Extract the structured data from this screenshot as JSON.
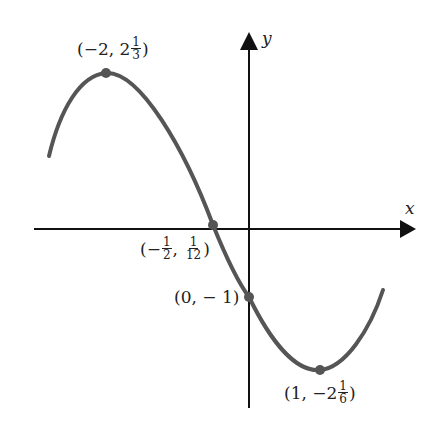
{
  "figure": {
    "type": "function-graph"
  },
  "axes": {
    "x_label": "x",
    "y_label": "y"
  },
  "points": [
    {
      "name": "local-maximum",
      "x": -2,
      "y": "2 1/3",
      "label": {
        "open": "(−2, 2",
        "num": "1",
        "den": "3",
        "close": ")"
      }
    },
    {
      "name": "x-intercept",
      "x": "-1/2",
      "y": "1/12",
      "label": {
        "open": "(−",
        "num1": "1",
        "den1": "2",
        "mid": ",",
        "num2": "1",
        "den2": "12",
        "close": ")"
      }
    },
    {
      "name": "y-intercept",
      "x": 0,
      "y": -1,
      "label": {
        "text": "(0, − 1)"
      }
    },
    {
      "name": "local-minimum",
      "x": 1,
      "y": "-2 1/6",
      "label": {
        "open": "(1, −2",
        "num": "1",
        "den": "6",
        "close": ")"
      }
    }
  ],
  "style": {
    "curve_color": "#555555",
    "axis_color": "#111111",
    "point_color": "#555555"
  }
}
